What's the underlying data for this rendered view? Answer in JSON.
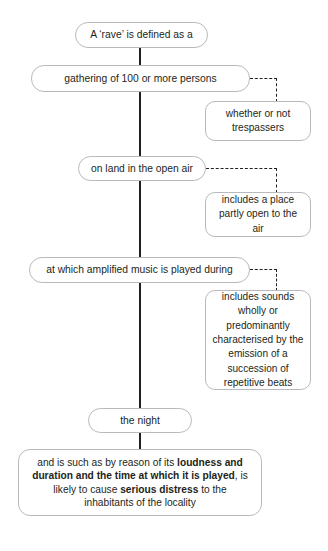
{
  "diagram": {
    "colors": {
      "text": "#231f20",
      "node_border": "#b9babd",
      "connector": "#231f20",
      "background": "#ffffff"
    },
    "spine_nodes": [
      {
        "id": "rave",
        "label": "A ‘rave’ is defined as a"
      },
      {
        "id": "gathering",
        "label": "gathering of 100 or more persons"
      },
      {
        "id": "onland",
        "label": "on land in the open air"
      },
      {
        "id": "amplified",
        "label": "at which amplified music is played during"
      },
      {
        "id": "night",
        "label": "the night"
      }
    ],
    "branch_nodes": [
      {
        "id": "trespassers",
        "label": "whether or not trespassers",
        "from": "gathering"
      },
      {
        "id": "partlyopen",
        "label": "includes a place partly open to the air",
        "from": "onland"
      },
      {
        "id": "sounds",
        "label": "includes sounds wholly or predominantly characterised by the emission of a succession of repetitive beats",
        "from": "amplified"
      }
    ],
    "final_node": {
      "id": "final",
      "segments": [
        {
          "text": "and is such as by reason of its ",
          "bold": false
        },
        {
          "text": "loudness and duration and the time at which it is played",
          "bold": true
        },
        {
          "text": ", is likely to cause ",
          "bold": false
        },
        {
          "text": "serious distress",
          "bold": true
        },
        {
          "text": " to the inhabitants of the locality",
          "bold": false
        }
      ],
      "plain_text": "and is such as by reason of its loudness and duration and the time at which it is played, is likely to cause serious distress to the inhabitants of the locality"
    }
  }
}
